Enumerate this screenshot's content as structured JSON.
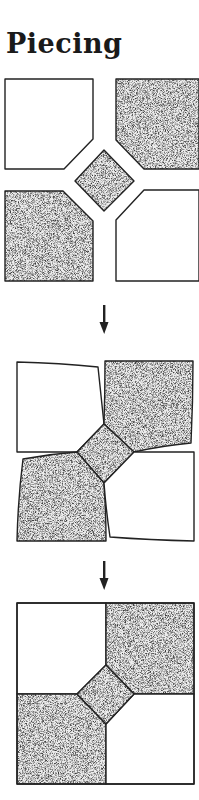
{
  "title": "Piecing",
  "colors": {
    "line": "#222222",
    "background": "#ffffff",
    "stipple_light": "#e6e6e6",
    "stipple_dark": "#555555"
  },
  "steps": [
    {
      "id": "step-1",
      "description": "Five separate pieces with corners trimmed: two white, two stippled corner pieces and a stippled center square"
    },
    {
      "id": "step-2",
      "description": "Pieces sewn together around the center square, still distorted"
    },
    {
      "id": "step-3",
      "description": "Finished pressed block: square with center diamond"
    }
  ],
  "arrows": [
    {
      "id": "arrow-1",
      "glyph": "down-arrow"
    },
    {
      "id": "arrow-2",
      "glyph": "down-arrow"
    }
  ]
}
